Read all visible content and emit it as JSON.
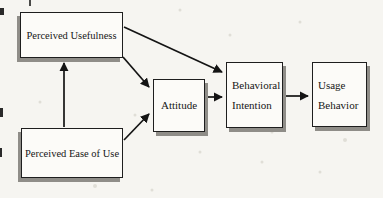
{
  "diagram": {
    "kind": "flow-diagram",
    "nodes": [
      {
        "id": "perceived-usefulness",
        "label": "Perceived Usefulness"
      },
      {
        "id": "perceived-ease-of-use",
        "label": "Perceived Ease of Use"
      },
      {
        "id": "attitude",
        "label": "Attitude"
      },
      {
        "id": "behavioral-intention",
        "label": "Behavioral Intention"
      },
      {
        "id": "usage-behavior",
        "label": "Usage Behavior"
      }
    ],
    "edges": [
      {
        "from": "perceived-ease-of-use",
        "to": "perceived-usefulness"
      },
      {
        "from": "perceived-usefulness",
        "to": "behavioral-intention"
      },
      {
        "from": "perceived-usefulness",
        "to": "attitude"
      },
      {
        "from": "perceived-ease-of-use",
        "to": "attitude"
      },
      {
        "from": "attitude",
        "to": "behavioral-intention"
      },
      {
        "from": "behavioral-intention",
        "to": "usage-behavior"
      }
    ],
    "colors": {
      "background": "#f6f5f1",
      "box_fill": "#fcfbf8",
      "box_border": "#1e1e1e",
      "box_shadow": "#8f8d88",
      "arrow": "#141414",
      "text": "#161616"
    }
  }
}
